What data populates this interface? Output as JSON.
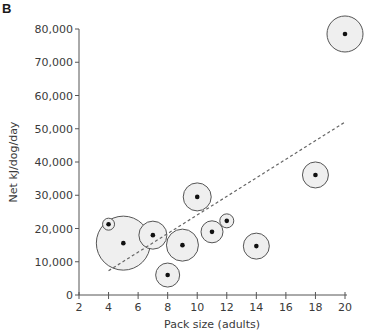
{
  "panel_label": "B",
  "chart_data": {
    "type": "scatter",
    "title": "",
    "xlabel": "Pack size (adults)",
    "ylabel": "Net kJ/dog/day",
    "xlim": [
      2,
      20
    ],
    "ylim": [
      0,
      80000
    ],
    "x_ticks": [
      2,
      4,
      6,
      8,
      10,
      12,
      14,
      16,
      18,
      20
    ],
    "x_tick_labels": [
      "2",
      "4",
      "6",
      "8",
      "10",
      "12",
      "14",
      "16",
      "18",
      "20"
    ],
    "y_ticks": [
      0,
      10000,
      20000,
      30000,
      40000,
      50000,
      60000,
      70000,
      80000
    ],
    "y_tick_labels": [
      "0",
      "10,000",
      "20,000",
      "30,000",
      "40,000",
      "50,000",
      "60,000",
      "70,000",
      "80,000"
    ],
    "grid": false,
    "legend": null,
    "marker_style": "black dot centered in light-gray bubble; bubble radius varies per point",
    "points": [
      {
        "x": 4,
        "y": 21300,
        "bubble_radius_px": 6
      },
      {
        "x": 5,
        "y": 15600,
        "bubble_radius_px": 27
      },
      {
        "x": 7,
        "y": 18000,
        "bubble_radius_px": 14
      },
      {
        "x": 8,
        "y": 6000,
        "bubble_radius_px": 12
      },
      {
        "x": 9,
        "y": 15000,
        "bubble_radius_px": 16
      },
      {
        "x": 10,
        "y": 29500,
        "bubble_radius_px": 14
      },
      {
        "x": 11,
        "y": 19000,
        "bubble_radius_px": 11
      },
      {
        "x": 12,
        "y": 22300,
        "bubble_radius_px": 7
      },
      {
        "x": 14,
        "y": 14700,
        "bubble_radius_px": 13
      },
      {
        "x": 18,
        "y": 36100,
        "bubble_radius_px": 13
      },
      {
        "x": 20,
        "y": 78500,
        "bubble_radius_px": 18
      }
    ],
    "trend_line": {
      "style": "dashed",
      "x": [
        4,
        20
      ],
      "y": [
        7300,
        52000
      ]
    }
  },
  "colors": {
    "axis": "#555555",
    "text": "#3a3a3a",
    "bubble_fill": "#efefef",
    "bubble_stroke": "#555555",
    "dot": "#111111",
    "trend": "#666666"
  }
}
